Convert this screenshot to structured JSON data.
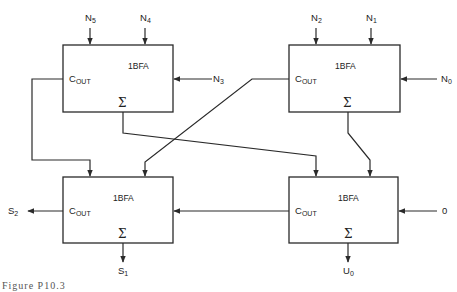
{
  "diagram": {
    "block_label": "1BFA",
    "cout_main": "C",
    "cout_sub": "OUT",
    "sum_symbol": "Σ",
    "blocks": [
      {
        "id": "top-left",
        "label": "1BFA"
      },
      {
        "id": "top-right",
        "label": "1BFA"
      },
      {
        "id": "bottom-left",
        "label": "1BFA"
      },
      {
        "id": "bottom-right",
        "label": "1BFA"
      }
    ],
    "inputs": {
      "n5": {
        "main": "N",
        "sub": "5"
      },
      "n4": {
        "main": "N",
        "sub": "4"
      },
      "n3": {
        "main": "N",
        "sub": "3"
      },
      "n2": {
        "main": "N",
        "sub": "2"
      },
      "n1": {
        "main": "N",
        "sub": "1"
      },
      "n0": {
        "main": "N",
        "sub": "0"
      },
      "zero": "0"
    },
    "outputs": {
      "s2": {
        "main": "S",
        "sub": "2"
      },
      "s1": {
        "main": "S",
        "sub": "1"
      },
      "s0": {
        "main": "U",
        "sub": "0"
      }
    },
    "caption": "Figure P10.3"
  }
}
